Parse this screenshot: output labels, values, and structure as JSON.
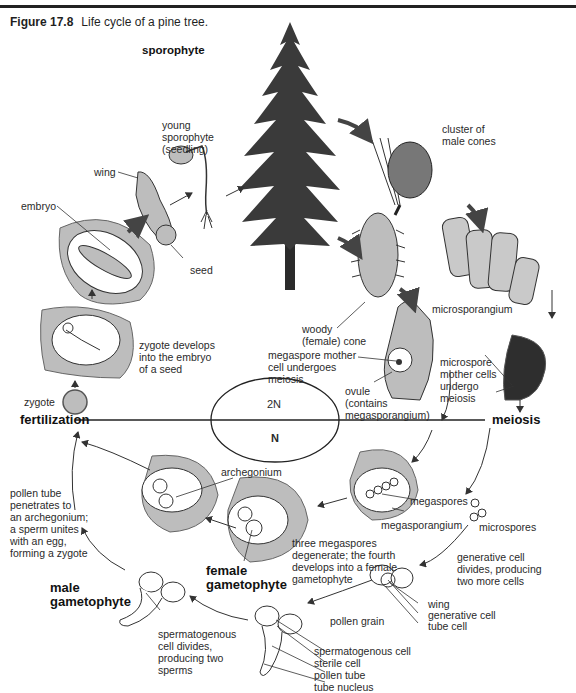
{
  "figure": {
    "number": "Figure 17.8",
    "caption": "Life cycle of a pine tree."
  },
  "ploidy": {
    "upper": "2N",
    "lower": "N"
  },
  "phases": {
    "sporophyte": "sporophyte",
    "fertilization": "fertilization",
    "meiosis": "meiosis",
    "female_gametophyte": "female\ngametophyte",
    "male_gametophyte": "male\ngametophyte"
  },
  "labels": {
    "young_sporophyte": "young\nsporophyte\n(seedling)",
    "wing_seed": "wing",
    "embryo": "embryo",
    "seed": "seed",
    "zygote_develops": "zygote develops\ninto the embryo\nof a seed",
    "zygote": "zygote",
    "cluster_male_cones": "cluster of\nmale cones",
    "microsporangium": "microsporangium",
    "woody_cone": "woody\n(female) cone",
    "megaspore_mother": "megaspore mother\ncell undergoes\nmeiosis",
    "ovule": "ovule\n(contains\nmegasporangium)",
    "microspore_mother": "microspore\nmother cells\nundergo\nmeiosis",
    "pollen_tube_penetrates": "pollen tube\npenetrates to\nan archegonium;\na sperm unites\nwith an egg,\nforming a zygote",
    "archegonium": "archegonium",
    "megaspores": "megaspores",
    "megasporangium": "megasporangium",
    "microspores": "microspores",
    "three_megaspores": "three megaspores\ndegenerate; the fourth\ndevelops into a female\ngametophyte",
    "generative_cell_divides": "generative cell\ndivides, producing\ntwo more cells",
    "pollen_wing": "wing",
    "generative_cell": "generative cell",
    "tube_cell": "tube cell",
    "pollen_grain": "pollen grain",
    "spermatogenous_cell": "spermatogenous cell",
    "sterile_cell": "sterile cell",
    "pollen_tube": "pollen tube",
    "tube_nucleus": "tube nucleus",
    "spermatogenous_divides": "spermatogenous\ncell divides,\nproducing two\nsperms"
  },
  "colors": {
    "tissue_gray": "#bdbdbd",
    "ink": "#222222",
    "dark_arrow": "#444444"
  }
}
